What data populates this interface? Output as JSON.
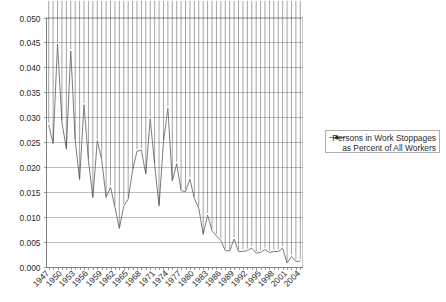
{
  "chart_data": {
    "type": "line",
    "title": "",
    "subtitle": "",
    "xlabel": "",
    "ylabel": "",
    "ylim": [
      0.0,
      0.05
    ],
    "ytick_step": 0.005,
    "ytick_labels": [
      "0.000",
      "0.005",
      "0.010",
      "0.015",
      "0.020",
      "0.025",
      "0.030",
      "0.035",
      "0.040",
      "0.045",
      "0.050"
    ],
    "ytick_values": [
      0.0,
      0.005,
      0.01,
      0.015,
      0.02,
      0.025,
      0.03,
      0.035,
      0.04,
      0.045,
      0.05
    ],
    "grid": "horizontal",
    "legend_position": "right",
    "legend_entries": [
      {
        "label_line_1": "Persons in Work Stoppages",
        "label_line_2": "as Percent of All Workers",
        "marker": "diamond",
        "marker_color": "#1a1a1a",
        "line_color": "#6d6d6d"
      }
    ],
    "x": [
      1947,
      1948,
      1949,
      1950,
      1951,
      1952,
      1953,
      1954,
      1955,
      1956,
      1957,
      1958,
      1959,
      1960,
      1961,
      1962,
      1963,
      1964,
      1965,
      1966,
      1967,
      1968,
      1969,
      1970,
      1971,
      1972,
      1973,
      1974,
      1975,
      1976,
      1977,
      1978,
      1979,
      1980,
      1981,
      1982,
      1983,
      1984,
      1985,
      1986,
      1987,
      1988,
      1989,
      1990,
      1991,
      1992,
      1993,
      1994,
      1995,
      1996,
      1997,
      1998,
      1999,
      2000,
      2001,
      2002,
      2003,
      2004
    ],
    "xtick_labels": [
      "1947",
      "1950",
      "1953",
      "1956",
      "1959",
      "1962",
      "1965",
      "1968",
      "1971",
      "1974",
      "1977",
      "1980",
      "1983",
      "1986",
      "1989",
      "1992",
      "1995",
      "1998",
      "2001",
      "2004"
    ],
    "xtick_label_interval": 3,
    "series": [
      {
        "name": "Persons in Work Stoppages as Percent of All Workers",
        "values": [
          0.0285,
          0.0247,
          0.0447,
          0.029,
          0.0236,
          0.0433,
          0.0253,
          0.0175,
          0.0325,
          0.0213,
          0.0139,
          0.0253,
          0.0216,
          0.0139,
          0.016,
          0.012,
          0.0077,
          0.0122,
          0.0136,
          0.0193,
          0.0232,
          0.0234,
          0.0186,
          0.0297,
          0.0205,
          0.0122,
          0.0251,
          0.0318,
          0.0172,
          0.0207,
          0.0153,
          0.0151,
          0.0176,
          0.0137,
          0.0118,
          0.0065,
          0.0104,
          0.0073,
          0.0062,
          0.0053,
          0.0033,
          0.0032,
          0.0056,
          0.0031,
          0.0031,
          0.0033,
          0.0038,
          0.0028,
          0.0029,
          0.0035,
          0.0029,
          0.0031,
          0.0031,
          0.0038,
          0.0008,
          0.0021,
          0.0011,
          0.0012
        ]
      }
    ]
  },
  "figure": {
    "background_color": "#ffffff",
    "plot_background_color": "#ffffff",
    "gridline_color": "#aeaeae",
    "border_color": "#b9b9b9",
    "series_line_color": "#6d6d6d",
    "marker_color": "#1a1a1a",
    "text_color": "#2b2b2b"
  }
}
